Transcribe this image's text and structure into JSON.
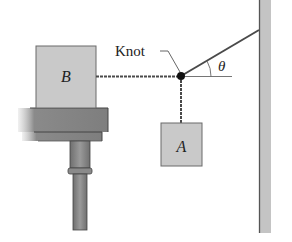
{
  "diagram": {
    "type": "physics-statics",
    "labels": {
      "block_b": "B",
      "block_a": "A",
      "knot": "Knot",
      "angle": "θ"
    },
    "colors": {
      "block_fill": "#c9c9c9",
      "block_stroke": "#6a6a6a",
      "table_fill": "#8a8a8a",
      "table_dark": "#5e5e5e",
      "wall_fill": "#c4c4c4",
      "wall_edge": "#555555",
      "cord": "#4a4a4a",
      "knot": "#111111"
    }
  }
}
